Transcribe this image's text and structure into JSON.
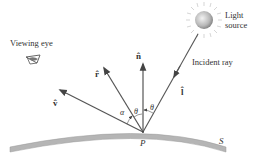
{
  "labels": {
    "viewing_eye": "Viewing eye",
    "light_source_line1": "Light",
    "light_source_line2": "source",
    "incident_ray": "Incident ray",
    "normal_vector": "n̂",
    "reflection_vector": "r̂",
    "view_vector": "v̂",
    "light_vector": "l̂",
    "angle_alpha": "α",
    "angle_theta_left": "θ",
    "angle_theta_right": "θ",
    "point": "P",
    "surface": "S"
  },
  "colors": {
    "line": "#555555",
    "surface_fill": "#b5b5b5",
    "sun_center": "#e8e8e8",
    "sun_edge": "#8a8a8a",
    "text": "#333333"
  }
}
